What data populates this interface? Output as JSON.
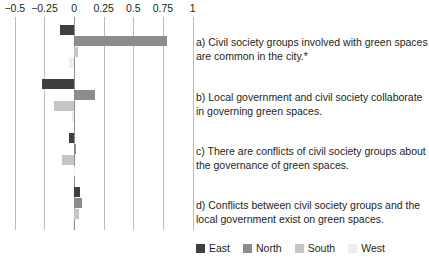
{
  "chart_data": {
    "type": "bar",
    "orientation": "horizontal",
    "stacked": false,
    "title": "",
    "xlabel": "",
    "ylabel": "",
    "xlim": [
      -0.625,
      1.0625
    ],
    "xticks": [
      -0.5,
      -0.25,
      0,
      0.25,
      0.5,
      0.75,
      1
    ],
    "xtick_labels": [
      "−0.5",
      "−0.25",
      "0",
      "0.25",
      "0.5",
      "0.75",
      "1"
    ],
    "grid": true,
    "zero_line": 0,
    "legend_position": "bottom-right",
    "categories": [
      "a) Civil society groups involved with green spaces are common in the city.*",
      "b) Local government and civil society collaborate in governing green spaces.",
      "c) There are conflicts of civil society groups about the governance of green spaces.",
      "d) Conflicts between civil society groups and the local government exist on green spaces."
    ],
    "series": [
      {
        "name": "East",
        "color": "#3f3f3f",
        "values": [
          -0.12,
          -0.27,
          -0.04,
          0.05
        ]
      },
      {
        "name": "North",
        "color": "#8c8c8c",
        "values": [
          0.78,
          0.18,
          0.02,
          0.07
        ]
      },
      {
        "name": "South",
        "color": "#c6c6c6",
        "values": [
          0.03,
          -0.17,
          -0.1,
          0.04
        ]
      },
      {
        "name": "West",
        "color": "#ededed",
        "values": [
          -0.04,
          -0.02,
          0.0,
          -0.01
        ]
      }
    ]
  },
  "axis": {
    "ticks": [
      {
        "label": "−0.5",
        "value": -0.5
      },
      {
        "label": "−0.25",
        "value": -0.25
      },
      {
        "label": "0",
        "value": 0
      },
      {
        "label": "0.25",
        "value": 0.25
      },
      {
        "label": "0.5",
        "value": 0.5
      },
      {
        "label": "0.75",
        "value": 0.75
      },
      {
        "label": "1",
        "value": 1
      }
    ]
  },
  "statements": [
    {
      "id": "a",
      "text": "a) Civil society groups involved with green spaces are common in the city.*"
    },
    {
      "id": "b",
      "text": "b) Local government and civil society collaborate in governing green spaces."
    },
    {
      "id": "c",
      "text": "c) There are conflicts of civil society groups about the governance of green spaces."
    },
    {
      "id": "d",
      "text": "d) Conflicts between civil society groups and the local government exist on green spaces."
    }
  ],
  "legend": {
    "items": [
      {
        "label": "East",
        "color": "#3f3f3f"
      },
      {
        "label": "North",
        "color": "#8c8c8c"
      },
      {
        "label": "South",
        "color": "#c6c6c6"
      },
      {
        "label": "West",
        "color": "#ededed"
      }
    ]
  }
}
